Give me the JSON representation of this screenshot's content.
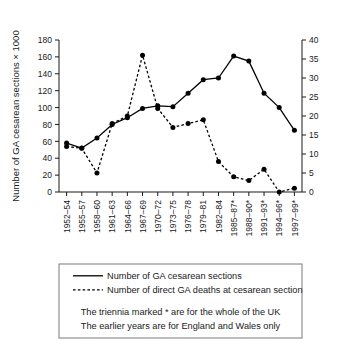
{
  "chart_data": {
    "type": "line",
    "title": "",
    "xlabel": "",
    "ylabel": "Number of GA cesarean sections × 1000",
    "ylabel_right": "",
    "ylim": [
      0,
      180
    ],
    "ylim_right": [
      0,
      40
    ],
    "yticks": [
      0,
      20,
      40,
      60,
      80,
      100,
      120,
      140,
      160,
      180
    ],
    "yticks_right": [
      0,
      5,
      10,
      15,
      20,
      25,
      30,
      35,
      40
    ],
    "grid": false,
    "legend_position": "below-plot",
    "categories": [
      "1952–54",
      "1955–57",
      "1958–60",
      "1961–63",
      "1964–66",
      "1967–69",
      "1970–72",
      "1973–75",
      "1976–78",
      "1979–81",
      "1982–84",
      "1985–87*",
      "1988–90*",
      "1991–93*",
      "1994–96*",
      "1997–99*"
    ],
    "series": [
      {
        "name": "Number of GA cesarean sections",
        "axis": "left",
        "style": "solid",
        "marker": "filled-circle",
        "values": [
          58,
          52,
          64,
          80,
          88,
          99,
          102,
          101,
          117,
          133,
          135,
          161,
          155,
          117,
          100,
          73
        ]
      },
      {
        "name": "Number of direct GA deaths at cesarean section",
        "axis": "right",
        "style": "dashed",
        "marker": "filled-circle",
        "values": [
          12,
          11.5,
          5,
          18,
          20,
          36,
          22,
          17,
          18,
          19,
          8,
          4,
          3,
          6,
          0,
          1
        ]
      }
    ],
    "annotations": [
      "The triennia marked * are for the whole of the UK",
      "The earlier years are for England and Wales only"
    ]
  },
  "legend": {
    "entries": [
      {
        "label": "Number of GA cesarean sections",
        "style": "solid"
      },
      {
        "label": "Number of direct GA deaths at cesarean section",
        "style": "dashed"
      }
    ],
    "notes": [
      "The triennia marked * are for the whole of the UK",
      "The earlier years are for England and Wales only"
    ]
  }
}
